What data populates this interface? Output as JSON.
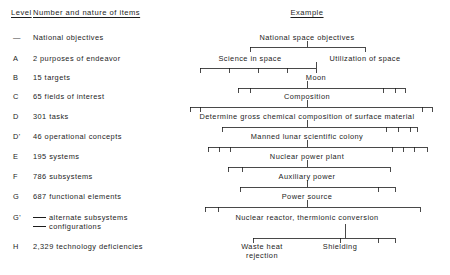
{
  "figure": {
    "headers": {
      "level": "Level",
      "items": "Number and nature of items",
      "example": "Example"
    }
  },
  "levels": [
    {
      "code": "—",
      "label": "National objectives",
      "y": 38
    },
    {
      "code": "A",
      "label": "2 purposes of endeavor",
      "y": 59
    },
    {
      "code": "B",
      "label": "15 targets",
      "y": 78
    },
    {
      "code": "C",
      "label": "65 fields of interest",
      "y": 97
    },
    {
      "code": "D",
      "label": "301 tasks",
      "y": 117
    },
    {
      "code": "D'",
      "label": "46 operational concepts",
      "y": 137
    },
    {
      "code": "E",
      "label": "195 systems",
      "y": 157
    },
    {
      "code": "F",
      "label": "786 subsystems",
      "y": 177
    },
    {
      "code": "G",
      "label": "687 functional elements",
      "y": 197
    },
    {
      "code": "G'",
      "label": "",
      "y": 218
    },
    {
      "code": "H",
      "label": "2,329 technology deficiencies",
      "y": 247
    }
  ],
  "legend": {
    "line1": "alternate subsystems",
    "line2": "configurations"
  },
  "tree": {
    "rows": [
      {
        "id": "national-space-objectives",
        "label": "National space objectives",
        "y": 38,
        "cx": 307
      },
      {
        "id": "science-in-space",
        "label": "Science in space",
        "y": 59,
        "cx": 250
      },
      {
        "id": "utilization-of-space",
        "label": "Utilization of space",
        "y": 59,
        "cx": 365
      },
      {
        "id": "moon",
        "label": "Moon",
        "y": 78,
        "cx": 316
      },
      {
        "id": "composition",
        "label": "Composition",
        "y": 97,
        "cx": 307
      },
      {
        "id": "determine-composition",
        "label": "Determine gross chemical composition of surface material",
        "y": 117,
        "cx": 307
      },
      {
        "id": "manned-lunar-colony",
        "label": "Manned lunar scientific colony",
        "y": 137,
        "cx": 307
      },
      {
        "id": "nuclear-power-plant",
        "label": "Nuclear power plant",
        "y": 157,
        "cx": 307
      },
      {
        "id": "auxiliary-power",
        "label": "Auxiliary power",
        "y": 177,
        "cx": 307
      },
      {
        "id": "power-source",
        "label": "Power source",
        "y": 197,
        "cx": 307
      },
      {
        "id": "nuclear-reactor",
        "label": "Nuclear reactor, thermionic conversion",
        "y": 218,
        "cx": 307
      },
      {
        "id": "waste-heat-rejection",
        "label": "Waste heat",
        "y": 247,
        "cx": 262
      },
      {
        "id": "waste-heat-rejection-2",
        "label": "rejection",
        "y": 256,
        "cx": 262
      },
      {
        "id": "shielding",
        "label": "Shielding",
        "y": 247,
        "cx": 340
      }
    ],
    "connectors": [
      {
        "id": "A",
        "bar_y": 47,
        "x1": 250,
        "x2": 365,
        "stem_x": 307,
        "stem_from": 41,
        "ticks": [
          250,
          365
        ]
      },
      {
        "id": "B",
        "bar_y": 68,
        "x1": 200,
        "x2": 316,
        "stem_x": 316,
        "stem_from": 62,
        "ticks": [
          200,
          229,
          258,
          287,
          316
        ]
      },
      {
        "id": "C",
        "bar_y": 88,
        "x1": 238,
        "x2": 405,
        "stem_x": 307,
        "stem_from": 81,
        "ticks": [
          238,
          250,
          383,
          395,
          405
        ]
      },
      {
        "id": "D",
        "bar_y": 107,
        "x1": 190,
        "x2": 432,
        "stem_x": 307,
        "stem_from": 100,
        "ticks": [
          190,
          200,
          422,
          432
        ]
      },
      {
        "id": "E",
        "bar_y": 127,
        "x1": 222,
        "x2": 417,
        "stem_x": 307,
        "stem_from": 120,
        "ticks": [
          222,
          386,
          398,
          410,
          417
        ]
      },
      {
        "id": "F",
        "bar_y": 147,
        "x1": 208,
        "x2": 427,
        "stem_x": 307,
        "stem_from": 140,
        "ticks": [
          208,
          219,
          230,
          392,
          403,
          414,
          427
        ]
      },
      {
        "id": "G",
        "bar_y": 167,
        "x1": 228,
        "x2": 390,
        "stem_x": 307,
        "stem_from": 160,
        "ticks": [
          228,
          242,
          390
        ]
      },
      {
        "id": "H",
        "bar_y": 187,
        "x1": 240,
        "x2": 395,
        "stem_x": 307,
        "stem_from": 180,
        "ticks": [
          240,
          378,
          395
        ]
      },
      {
        "id": "I",
        "bar_y": 207,
        "x1": 205,
        "x2": 420,
        "stem_x": 307,
        "stem_from": 200,
        "ticks": [
          205,
          218,
          420
        ]
      },
      {
        "id": "J",
        "bar_y": 238,
        "x1": 253,
        "x2": 395,
        "stem_x": 345,
        "stem_from": 224,
        "ticks": [
          253,
          340,
          378,
          395
        ]
      }
    ]
  }
}
